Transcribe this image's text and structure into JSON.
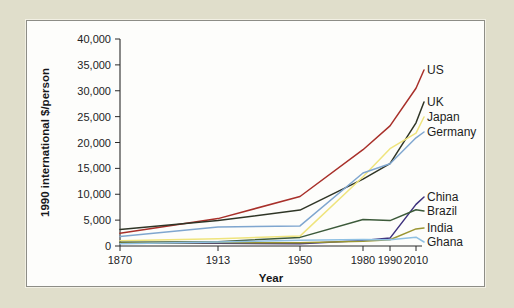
{
  "figure": {
    "background_color": "#e0decb",
    "panel_color": "#fdfdfb",
    "panel_border_color": "#8d8d86"
  },
  "chart_data": {
    "type": "line",
    "title": "",
    "xlabel": "Year",
    "ylabel": "1990 international $/person",
    "categories": [
      "1870",
      "1913",
      "1950",
      "1980",
      "1990",
      "2010"
    ],
    "x": [
      1870,
      1913,
      1950,
      1980,
      1990,
      2010
    ],
    "x_spacing": "ordinal-nonlinear",
    "xtick_positions_px": [
      120,
      218,
      300,
      363,
      390,
      416
    ],
    "ylim": [
      0,
      40000
    ],
    "yticks": [
      0,
      5000,
      10000,
      15000,
      20000,
      25000,
      30000,
      35000,
      40000
    ],
    "ytick_labels": [
      "0",
      "5,000",
      "10,000",
      "15,000",
      "20,000",
      "25,000",
      "30,000",
      "35,000",
      "40,000"
    ],
    "grid": false,
    "legend_position": "right-inline-labels",
    "series": [
      {
        "name": "US",
        "color": "#a8302a",
        "values": [
          2450,
          5300,
          9560,
          18600,
          23200,
          30500
        ]
      },
      {
        "name": "UK",
        "color": "#2f3526",
        "values": [
          3190,
          4920,
          6940,
          12900,
          15900,
          23800
        ]
      },
      {
        "name": "Japan",
        "color": "#efe47d",
        "values": [
          1010,
          1390,
          1920,
          13400,
          18800,
          21800
        ]
      },
      {
        "name": "Germany",
        "color": "#7fa6cf",
        "values": [
          1840,
          3650,
          3880,
          14100,
          15900,
          20900
        ]
      },
      {
        "name": "China",
        "color": "#3d317d",
        "values": [
          530,
          550,
          450,
          1060,
          1520,
          8030
        ]
      },
      {
        "name": "Brazil",
        "color": "#3c5a3a",
        "values": [
          720,
          810,
          1670,
          5120,
          4900,
          7010
        ]
      },
      {
        "name": "India",
        "color": "#9a9532",
        "values": [
          530,
          670,
          620,
          930,
          1200,
          3300
        ]
      },
      {
        "name": "Ghana",
        "color": "#8fc0e3",
        "values": [
          430,
          780,
          1120,
          1280,
          1190,
          1700
        ]
      }
    ]
  }
}
